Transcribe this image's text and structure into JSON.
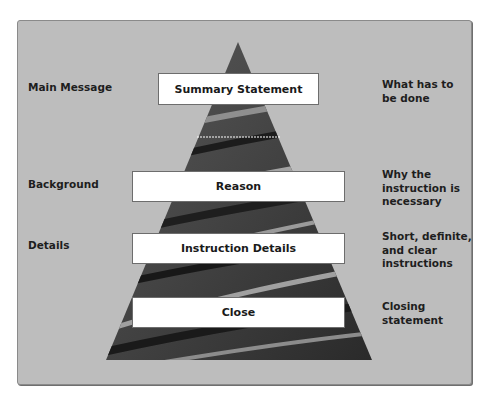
{
  "diagram": {
    "type": "pyramid",
    "levels": [
      {
        "left_label": "Main Message",
        "box_label": "Summary Statement",
        "right_label_lines": [
          "What has to",
          "be done"
        ]
      },
      {
        "left_label": "Background",
        "box_label": "Reason",
        "right_label_lines": [
          "Why the",
          "instruction is",
          "necessary"
        ]
      },
      {
        "left_label": "Details",
        "box_label": "Instruction Details",
        "right_label_lines": [
          "Short, definite,",
          "and clear",
          "instructions"
        ]
      },
      {
        "left_label": "",
        "box_label": "Close",
        "right_label_lines": [
          "Closing",
          "statement"
        ]
      }
    ],
    "colors": {
      "panel": "#bdbdbd",
      "pyramid_dark": "#2e2e2e",
      "pyramid_light": "#9a9a9a",
      "box": "#ffffff"
    }
  }
}
